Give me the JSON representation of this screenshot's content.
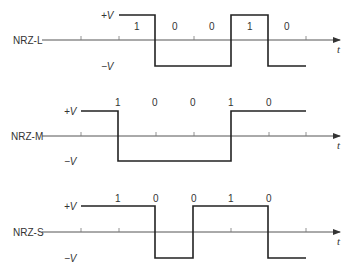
{
  "diagram": {
    "time_axis_label": "t",
    "level_labels": {
      "high": "+V",
      "low": "−V"
    },
    "bit_boundaries_x": [
      81,
      119,
      156,
      194,
      231,
      269,
      306
    ],
    "rows": [
      {
        "name": "NRZ-L",
        "axis_y": 40,
        "high_y": 15,
        "low_y": 66,
        "bits": [
          "1",
          "0",
          "0",
          "1",
          "0"
        ],
        "bit_label_positions": [
          [
            137,
            29
          ],
          [
            175,
            29
          ],
          [
            212,
            29
          ],
          [
            250,
            29
          ],
          [
            287,
            29
          ]
        ],
        "waveform_levels": [
          "high",
          "low",
          "low",
          "high",
          "low"
        ],
        "waveform_start_x": 119
      },
      {
        "name": "NRZ-M",
        "axis_y": 136,
        "high_y": 111,
        "low_y": 161,
        "bits": [
          "1",
          "0",
          "0",
          "1",
          "0"
        ],
        "bit_label_positions": [
          [
            118,
            104
          ],
          [
            155,
            104
          ],
          [
            193,
            104
          ],
          [
            231,
            104
          ],
          [
            269,
            104
          ]
        ],
        "waveform_levels": [
          "high",
          "low",
          "low",
          "low",
          "high",
          "high"
        ],
        "waveform_start_x": 81
      },
      {
        "name": "NRZ-S",
        "axis_y": 232,
        "high_y": 206,
        "low_y": 259,
        "bits": [
          "1",
          "0",
          "0",
          "1",
          "0"
        ],
        "bit_label_positions": [
          [
            118,
            200
          ],
          [
            156,
            200
          ],
          [
            194,
            200
          ],
          [
            231,
            200
          ],
          [
            269,
            200
          ]
        ],
        "waveform_levels": [
          "high",
          "high",
          "low",
          "high",
          "high",
          "low"
        ],
        "waveform_start_x": 81
      }
    ]
  }
}
